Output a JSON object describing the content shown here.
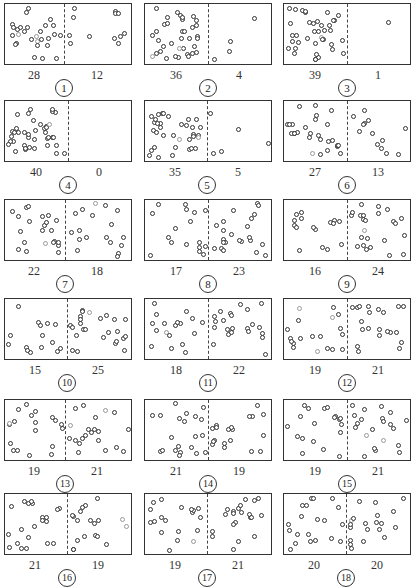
{
  "title": "",
  "colors": {
    "ink": "#333333",
    "faint_particle": "#999999",
    "background": "#ffffff"
  },
  "layout": {
    "columns_x": [
      4,
      144,
      283
    ],
    "rows_y": [
      3,
      100,
      199,
      298,
      399,
      493
    ],
    "divider_fraction": [
      0.47,
      0.5,
      0.5,
      0.5,
      0.49,
      0.5,
      0.48,
      0.5,
      0.5,
      0.49,
      0.5,
      0.5,
      0.48,
      0.5,
      0.5,
      0.49,
      0.49,
      0.49
    ]
  },
  "panels": [
    {
      "step": "1",
      "left": "28",
      "right": "12"
    },
    {
      "step": "2",
      "left": "36",
      "right": "4"
    },
    {
      "step": "3",
      "left": "39",
      "right": "1"
    },
    {
      "step": "4",
      "left": "40",
      "right": "0"
    },
    {
      "step": "5",
      "left": "35",
      "right": "5"
    },
    {
      "step": "6",
      "left": "27",
      "right": "13"
    },
    {
      "step": "7",
      "left": "22",
      "right": "18"
    },
    {
      "step": "8",
      "left": "17",
      "right": "23"
    },
    {
      "step": "9",
      "left": "16",
      "right": "24"
    },
    {
      "step": "10",
      "left": "15",
      "right": "25"
    },
    {
      "step": "11",
      "left": "18",
      "right": "22"
    },
    {
      "step": "12",
      "left": "19",
      "right": "21"
    },
    {
      "step": "13",
      "left": "19",
      "right": "21"
    },
    {
      "step": "14",
      "left": "21",
      "right": "19"
    },
    {
      "step": "15",
      "left": "19",
      "right": "21"
    },
    {
      "step": "16",
      "left": "21",
      "right": "19"
    },
    {
      "step": "17",
      "left": "19",
      "right": "21"
    },
    {
      "step": "18",
      "left": "20",
      "right": "20"
    }
  ],
  "chart_data": {
    "type": "table",
    "columns": [
      "step",
      "left_count",
      "right_count"
    ],
    "rows": [
      [
        1,
        28,
        12
      ],
      [
        2,
        36,
        4
      ],
      [
        3,
        39,
        1
      ],
      [
        4,
        40,
        0
      ],
      [
        5,
        35,
        5
      ],
      [
        6,
        27,
        13
      ],
      [
        7,
        22,
        18
      ],
      [
        8,
        17,
        23
      ],
      [
        9,
        16,
        24
      ],
      [
        10,
        15,
        25
      ],
      [
        11,
        18,
        22
      ],
      [
        12,
        19,
        21
      ],
      [
        13,
        19,
        21
      ],
      [
        14,
        21,
        19
      ],
      [
        15,
        19,
        21
      ],
      [
        16,
        21,
        19
      ],
      [
        17,
        19,
        21
      ],
      [
        18,
        20,
        20
      ]
    ],
    "total_particles": 40
  }
}
